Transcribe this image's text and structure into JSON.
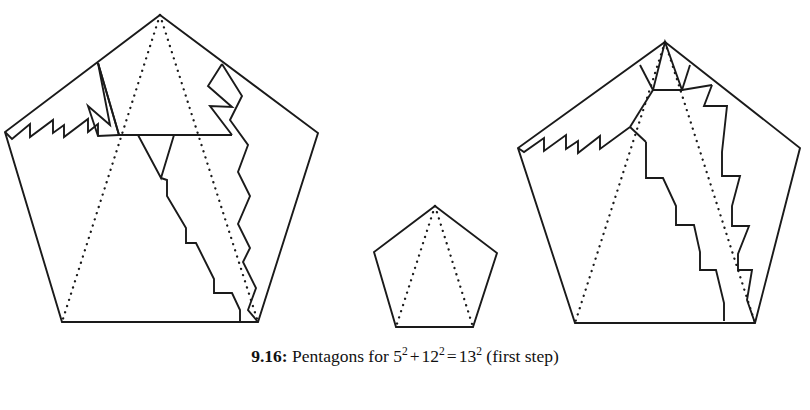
{
  "figure": {
    "caption_number": "9.16:",
    "caption_text_before": "Pentagons for",
    "term1_base": "5",
    "term1_exp": "2",
    "plus": "+",
    "term2_base": "12",
    "term2_exp": "2",
    "equals": "=",
    "term3_base": "13",
    "term3_exp": "2",
    "caption_text_after": "(first step)",
    "background_color": "#ffffff",
    "ink_color": "#1a1a1a"
  },
  "diagram": {
    "title": "Pentagon dissection for the Pythagorean identity",
    "shapes": [
      {
        "name": "large-pentagon-13",
        "role": "target pentagon of side 13",
        "outline": "M160,15 L318,133 L258,322 L62,322 L5,132 Z",
        "pieces": [
          "stair-cut left sawtooth",
          "central trapezoid piece",
          "right wedge pieces",
          "descending staircase cut"
        ],
        "dotted_guides": [
          "apex to bottom-left vertex",
          "apex to bottom-right vertex"
        ]
      },
      {
        "name": "small-pentagon-5",
        "role": "source pentagon of side 5",
        "outline": "M435,206 L497,253 L473,327 L396,327 L374,252 Z",
        "pieces": [],
        "dotted_guides": [
          "apex to bottom-left vertex",
          "apex to bottom-right vertex"
        ]
      },
      {
        "name": "medium-pentagon-12",
        "role": "source pentagon of side 12",
        "outline": "M665,42 L800,148 L755,323 L575,323 L518,148 Z",
        "pieces": [
          "apex triangle",
          "left sawtooth cut",
          "twin descending staircases"
        ],
        "dotted_guides": [
          "apex to bottom-left vertex",
          "apex to bottom-right vertex"
        ]
      }
    ]
  }
}
